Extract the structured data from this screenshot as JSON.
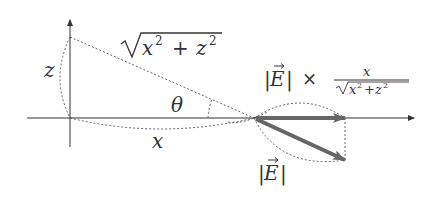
{
  "diagram": {
    "colors": {
      "axis": "#333333",
      "dotted": "#555555",
      "vector": "#666666",
      "text": "#333333",
      "background": "#ffffff"
    },
    "labels": {
      "z": "z",
      "x": "x",
      "theta": "θ",
      "hypotenuse": "√(x² + z²)",
      "hyp_x": "x",
      "hyp_plus": "+",
      "hyp_z": "z",
      "sup2": "2",
      "projection_E": "|E|",
      "projection_times": "×",
      "fraction_numerator": "x",
      "fraction_denominator_x": "x",
      "fraction_denominator_plus": "+",
      "fraction_denominator_z": "z",
      "vector_E": "|E|",
      "vec_letter": "E",
      "bar": "|"
    },
    "geometry": {
      "origin": [
        70,
        118
      ],
      "z_point": [
        70,
        37
      ],
      "angle_vertex": [
        254,
        118
      ],
      "horizontal_vector_end": [
        345,
        118
      ],
      "field_vector_end": [
        345,
        160
      ]
    }
  }
}
